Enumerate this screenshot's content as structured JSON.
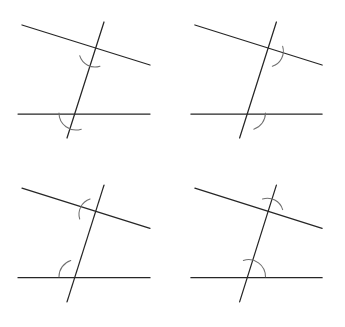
{
  "figure": {
    "background_color": "#ffffff",
    "line_color": "#262626",
    "arc_color": "#6f6f6f",
    "canvas": {
      "width": 345,
      "height": 327
    },
    "panel_size": {
      "width": 172,
      "height": 163
    }
  },
  "geometry": {
    "top_line": {
      "x1": 22,
      "y1": 25,
      "x2": 150,
      "y2": 65
    },
    "bottom_line": {
      "x1": 18,
      "y1": 114,
      "x2": 150,
      "y2": 114
    },
    "transversal": {
      "x1": 104,
      "y1": 22,
      "x2": 67,
      "y2": 138
    },
    "upper_intersection": {
      "x": 95,
      "y": 51
    },
    "lower_intersection": {
      "x": 76,
      "y": 113
    },
    "arc_radius_upper": 16,
    "arc_radius_lower": 17
  },
  "panels": [
    {
      "id": "panel-top-left",
      "position": "top-left",
      "upper_arc": {
        "name": "upper-left-angle-arc",
        "quadrant": "upper-left",
        "start_deg": 197,
        "end_deg": 288
      },
      "lower_arc": {
        "name": "upper-left-angle-arc",
        "quadrant": "upper-left",
        "start_deg": 180,
        "end_deg": 288
      }
    },
    {
      "id": "panel-top-right",
      "position": "top-right",
      "upper_arc": {
        "name": "upper-right-angle-arc",
        "quadrant": "upper-right",
        "start_deg": 288,
        "end_deg": 377
      },
      "lower_arc": {
        "name": "upper-right-angle-arc",
        "quadrant": "upper-right",
        "start_deg": 288,
        "end_deg": 360
      }
    },
    {
      "id": "panel-bottom-left",
      "position": "bottom-left",
      "upper_arc": {
        "name": "lower-left-angle-arc",
        "quadrant": "lower-left",
        "start_deg": 108,
        "end_deg": 197
      },
      "lower_arc": {
        "name": "lower-left-angle-arc",
        "quadrant": "lower-left",
        "start_deg": 108,
        "end_deg": 180
      }
    },
    {
      "id": "panel-bottom-right",
      "position": "bottom-right",
      "upper_arc": {
        "name": "lower-right-angle-arc",
        "quadrant": "lower-right",
        "start_deg": 17,
        "end_deg": 108
      },
      "lower_arc": {
        "name": "lower-right-angle-arc",
        "quadrant": "lower-right",
        "start_deg": 0,
        "end_deg": 108
      }
    }
  ]
}
